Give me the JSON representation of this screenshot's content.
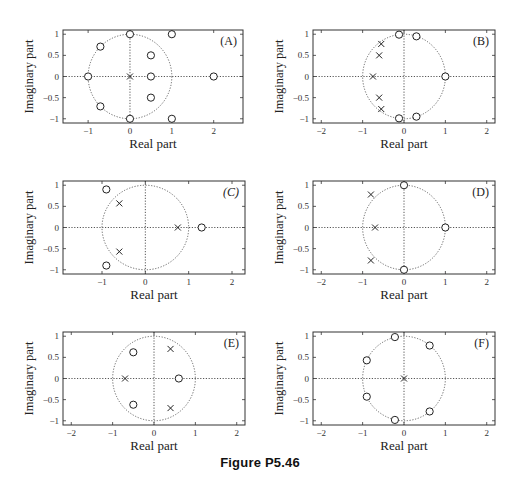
{
  "figure": {
    "caption": "Figure P5.46"
  },
  "chart_data": [
    {
      "type": "scatter",
      "label": "(A)",
      "xlabel": "Real part",
      "ylabel": "Imaginary part",
      "xlim": [
        -1.6,
        2.7
      ],
      "ylim": [
        -1.1,
        1.1
      ],
      "xticks": [
        -1,
        0,
        1,
        2
      ],
      "yticks": [
        -1,
        -0.5,
        0,
        0.5,
        1
      ],
      "unit_circle": true,
      "zeros": [
        [
          0,
          1
        ],
        [
          0,
          -1
        ],
        [
          -1,
          0
        ],
        [
          0.5,
          0
        ],
        [
          2,
          0
        ],
        [
          1,
          1
        ],
        [
          1,
          -1
        ],
        [
          0.5,
          0.5
        ],
        [
          0.5,
          -0.5
        ],
        [
          -0.707,
          0.707
        ],
        [
          -0.707,
          -0.707
        ]
      ],
      "poles": [
        [
          0,
          0
        ]
      ]
    },
    {
      "type": "scatter",
      "label": "(B)",
      "xlabel": "Real part",
      "ylabel": "Imaginary part",
      "xlim": [
        -2.2,
        2.2
      ],
      "ylim": [
        -1.1,
        1.1
      ],
      "xticks": [
        -2,
        -1,
        0,
        1,
        2
      ],
      "yticks": [
        -1,
        -0.5,
        0,
        0.5,
        1
      ],
      "unit_circle": true,
      "zeros": [
        [
          1,
          0
        ],
        [
          -0.12,
          0.99
        ],
        [
          -0.12,
          -0.99
        ],
        [
          0.3,
          0.95
        ],
        [
          0.3,
          -0.95
        ]
      ],
      "poles": [
        [
          -0.75,
          0
        ],
        [
          -0.6,
          0.5
        ],
        [
          -0.6,
          -0.5
        ],
        [
          -0.55,
          0.77
        ],
        [
          -0.55,
          -0.77
        ]
      ]
    },
    {
      "type": "scatter",
      "label": "(C)",
      "xlabel": "Real part",
      "ylabel": "Imaginary part",
      "xlim": [
        -1.9,
        2.3
      ],
      "ylim": [
        -1.1,
        1.1
      ],
      "xticks": [
        -1,
        0,
        1,
        2
      ],
      "yticks": [
        -1,
        -0.5,
        0,
        0.5,
        1
      ],
      "unit_circle": true,
      "zeros": [
        [
          -0.9,
          0.9
        ],
        [
          -0.9,
          -0.9
        ],
        [
          1.3,
          0
        ]
      ],
      "poles": [
        [
          -0.6,
          0.57
        ],
        [
          -0.6,
          -0.57
        ],
        [
          0.75,
          0
        ]
      ]
    },
    {
      "type": "scatter",
      "label": "(D)",
      "xlabel": "Real part",
      "ylabel": "Imaginary part",
      "xlim": [
        -2.2,
        2.2
      ],
      "ylim": [
        -1.1,
        1.1
      ],
      "xticks": [
        -2,
        -1,
        0,
        1,
        2
      ],
      "yticks": [
        -1,
        -0.5,
        0,
        0.5,
        1
      ],
      "unit_circle": true,
      "zeros": [
        [
          0,
          1
        ],
        [
          0,
          -1
        ],
        [
          1,
          0
        ]
      ],
      "poles": [
        [
          -0.8,
          0.78
        ],
        [
          -0.8,
          -0.78
        ],
        [
          -0.7,
          0
        ]
      ]
    },
    {
      "type": "scatter",
      "label": "(E)",
      "xlabel": "Real part",
      "ylabel": "Imaginary part",
      "xlim": [
        -2.2,
        2.2
      ],
      "ylim": [
        -1.1,
        1.1
      ],
      "xticks": [
        -2,
        -1,
        0,
        1,
        2
      ],
      "yticks": [
        -1,
        -0.5,
        0,
        0.5,
        1
      ],
      "unit_circle": true,
      "zeros": [
        [
          -0.5,
          0.62
        ],
        [
          -0.5,
          -0.62
        ],
        [
          0.6,
          0
        ]
      ],
      "poles": [
        [
          0.4,
          0.7
        ],
        [
          0.4,
          -0.7
        ],
        [
          -0.7,
          0
        ]
      ]
    },
    {
      "type": "scatter",
      "label": "(F)",
      "xlabel": "Real part",
      "ylabel": "Imaginary part",
      "xlim": [
        -2.2,
        2.2
      ],
      "ylim": [
        -1.1,
        1.1
      ],
      "xticks": [
        -2,
        -1,
        0,
        1,
        2
      ],
      "yticks": [
        -1,
        -0.5,
        0,
        0.5,
        1
      ],
      "unit_circle": true,
      "zeros": [
        [
          -0.22,
          0.98
        ],
        [
          -0.22,
          -0.98
        ],
        [
          0.62,
          0.78
        ],
        [
          0.62,
          -0.78
        ],
        [
          -0.9,
          0.43
        ],
        [
          -0.9,
          -0.43
        ]
      ],
      "poles": [
        [
          0,
          0
        ]
      ]
    }
  ]
}
